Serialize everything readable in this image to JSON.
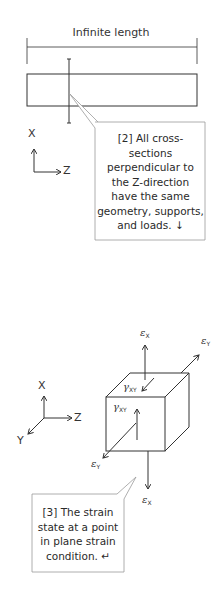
{
  "figure1": {
    "title": "Infinite length",
    "axis_x": "X",
    "axis_z": "Z",
    "callout_text": "[2] All cross-sections perpendicular to the Z-direction have the same geometry, supports, and loads. ↓",
    "callout_lines": [
      "[2] All cross-",
      "sections",
      "perpendicular to",
      "the Z-direction",
      "have the same",
      "geometry, supports,",
      "and loads. ↓"
    ]
  },
  "figure2": {
    "axis_x": "X",
    "axis_y": "Y",
    "axis_z": "Z",
    "labels": {
      "eps_x_top": {
        "sym": "ε",
        "sub": "X"
      },
      "eps_y_top": {
        "sym": "ε",
        "sub": "Y"
      },
      "gamma_back": {
        "sym": "γ",
        "sub": "XY"
      },
      "gamma_front": {
        "sym": "γ",
        "sub": "XY"
      },
      "eps_y_bottom": {
        "sym": "ε",
        "sub": "Y"
      },
      "eps_x_bottom": {
        "sym": "ε",
        "sub": "X"
      }
    },
    "callout_lines": [
      "[3] The strain",
      "state at a point",
      "in plane strain",
      "condition. ↵"
    ]
  },
  "colors": {
    "line": "#333333",
    "callout_border": "#9a9a9a",
    "background": "#ffffff"
  }
}
